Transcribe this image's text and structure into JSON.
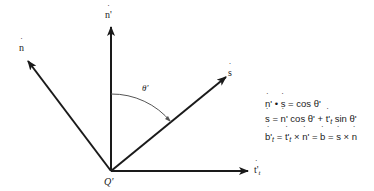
{
  "diagram": {
    "origin": {
      "label": "Q'",
      "x": 111,
      "y": 171
    },
    "vectors": [
      {
        "id": "n_prime",
        "label": "n'",
        "from": [
          111,
          171
        ],
        "to": [
          111,
          26
        ],
        "label_pos": [
          106,
          10
        ]
      },
      {
        "id": "n",
        "label": "n",
        "from": [
          111,
          171
        ],
        "to": [
          27,
          60
        ],
        "label_pos": [
          19,
          42
        ]
      },
      {
        "id": "s",
        "label": "s",
        "from": [
          111,
          171
        ],
        "to": [
          226,
          78
        ],
        "label_pos": [
          228,
          66
        ]
      },
      {
        "id": "t_prime_t",
        "label": "t'",
        "subscript": "t",
        "from": [
          111,
          171
        ],
        "to": [
          248,
          171
        ],
        "label_pos": [
          254,
          165
        ]
      }
    ],
    "angle": {
      "label": "θ'",
      "label_pos": [
        143,
        83
      ]
    },
    "color": "#1a1a1a",
    "arc_color": "#555555"
  },
  "equations": [
    {
      "id": "eq1",
      "text": "n' • s = cos θ'"
    },
    {
      "id": "eq2",
      "text": "s = n' cos θ' + t'_t sin θ'"
    },
    {
      "id": "eq3",
      "text": "b'_t = t'_t × n' = b = s × n"
    }
  ],
  "eq_parts": {
    "eq1": {
      "a": "n",
      "a_sup": "'",
      "dot": " • ",
      "b": "s",
      "rest": " = cos θ'"
    },
    "eq2": {
      "a": "s",
      "eqs": " = ",
      "b": "n",
      "b_sup": "'",
      "cos": " cos θ' + ",
      "c": "t'",
      "c_sub": "t",
      "sin": " sin θ'"
    },
    "eq3": {
      "a": "b'",
      "a_sub": "t",
      "eqs": " = ",
      "b": "t'",
      "b_sub": "t",
      "cross": " × ",
      "c": "n",
      "c_sup": "'",
      "eq2s": " = ",
      "d": "b",
      "eq3s": " = ",
      "e": "s",
      "cross2": " × ",
      "f": "n"
    }
  }
}
